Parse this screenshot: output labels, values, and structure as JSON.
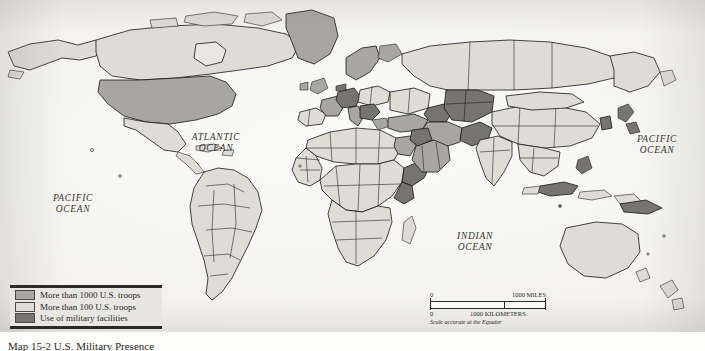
{
  "map": {
    "title_caption": "Map 15-2  U.S. Military Presence",
    "ocean_labels": {
      "atlantic": "ATLANTIC\nOCEAN",
      "pacific_left": "PACIFIC\nOCEAN",
      "pacific_right": "PACIFIC\nOCEAN",
      "indian": "INDIAN\nOCEAN"
    },
    "colors": {
      "paper": "#f4f3f0",
      "ocean": "#fbfbf9",
      "country_outline": "#171614",
      "troops_1000": "#a8a6a0",
      "troops_100": "#dedcd5",
      "facilities": "#76746e"
    }
  },
  "legend": {
    "items": [
      {
        "label": "More than 1000 U.S. troops",
        "swatch": "#a8a6a0"
      },
      {
        "label": "More than 100 U.S. troops",
        "swatch": "#dedcd5"
      },
      {
        "label": "Use of military facilities",
        "swatch": "#76746e"
      }
    ]
  },
  "scale_bar": {
    "miles_min": "0",
    "miles_max": "1000 MILES",
    "km_min": "0",
    "km_max": "1000 KILOMETERS",
    "note": "Scale accurate at the Equator"
  }
}
